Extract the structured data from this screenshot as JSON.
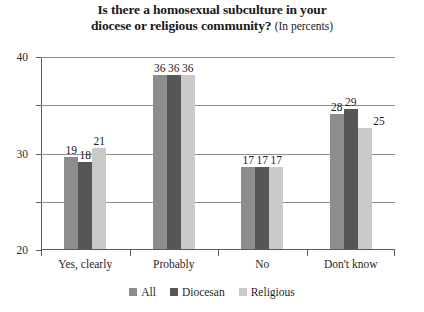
{
  "chart_data": {
    "type": "bar",
    "title": "Is there a homosexual subculture in your diocese or religious community? (In percents)",
    "title_lines": [
      "Is there a homosexual subculture in your",
      "diocese or religious community?"
    ],
    "title_suffix": "(In percents)",
    "subtitle": "",
    "xlabel": "",
    "ylabel": "",
    "ylim": [
      0,
      40
    ],
    "yticks": [
      0,
      10,
      20,
      30,
      40
    ],
    "ytick_labels": [
      "0",
      "10",
      "20",
      "30",
      "40"
    ],
    "grid": true,
    "legend_position": "bottom-center",
    "categories": [
      "Yes, clearly",
      "Probably",
      "No",
      "Don't know"
    ],
    "series": [
      {
        "name": "All",
        "color": "#8d8d8d",
        "values": [
          19,
          36,
          17,
          28
        ],
        "value_labels": [
          "19",
          "36",
          "17",
          "28"
        ]
      },
      {
        "name": "Diocesan",
        "color": "#565656",
        "values": [
          18,
          36,
          17,
          29
        ],
        "value_labels": [
          "18",
          "36",
          "17",
          "29"
        ]
      },
      {
        "name": "Religious",
        "color": "#c9c9c9",
        "values": [
          21,
          36,
          17,
          25
        ],
        "value_labels": [
          "21",
          "36",
          "17",
          "25"
        ]
      }
    ]
  },
  "colors": {
    "background": "#ffffff",
    "axis": "#5b5b5b",
    "gridline": "#8f8f8f",
    "text": "#1a1a1a",
    "all": "#8d8d8d",
    "diocesan": "#565656",
    "religious": "#c9c9c9"
  }
}
